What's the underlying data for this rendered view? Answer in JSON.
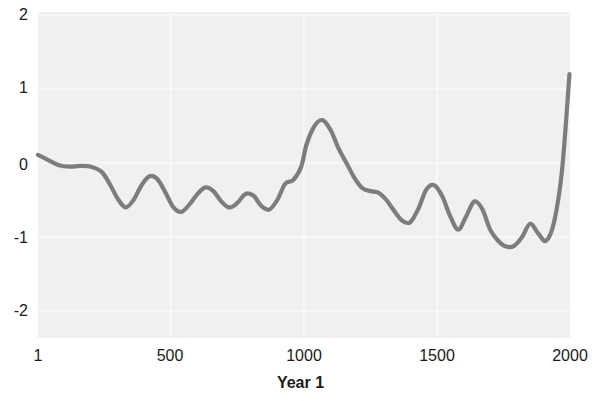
{
  "chart_data": {
    "type": "line",
    "title": "",
    "xlabel": "Year 1",
    "ylabel": "",
    "xlim": [
      1,
      2000
    ],
    "ylim": [
      -2.4,
      2.2
    ],
    "xticks": [
      1,
      500,
      1000,
      1500,
      2000
    ],
    "xtick_labels": [
      "1",
      "500",
      "1000",
      "1500",
      "2000"
    ],
    "yticks": [
      2,
      1,
      0,
      -1,
      -2
    ],
    "ytick_labels": [
      "2",
      "1",
      "0",
      "-1",
      "-2"
    ],
    "grid": true,
    "legend": "none",
    "line_color": "#7d7d7d",
    "plot_background": "#f0f0f0",
    "series": [
      {
        "name": "series-1",
        "x": [
          1,
          40,
          80,
          120,
          160,
          200,
          240,
          270,
          300,
          330,
          360,
          390,
          420,
          450,
          480,
          510,
          540,
          570,
          600,
          630,
          660,
          690,
          720,
          750,
          780,
          810,
          840,
          870,
          900,
          930,
          960,
          990,
          1010,
          1040,
          1070,
          1100,
          1130,
          1160,
          1190,
          1220,
          1250,
          1280,
          1310,
          1340,
          1370,
          1400,
          1430,
          1460,
          1490,
          1520,
          1550,
          1580,
          1610,
          1640,
          1670,
          1700,
          1730,
          1760,
          1790,
          1820,
          1850,
          1880,
          1910,
          1940,
          1970,
          1998
        ],
        "y": [
          0.11,
          0.04,
          -0.03,
          -0.05,
          -0.04,
          -0.05,
          -0.12,
          -0.28,
          -0.48,
          -0.6,
          -0.5,
          -0.3,
          -0.18,
          -0.22,
          -0.4,
          -0.6,
          -0.66,
          -0.56,
          -0.42,
          -0.33,
          -0.38,
          -0.52,
          -0.6,
          -0.54,
          -0.42,
          -0.44,
          -0.58,
          -0.63,
          -0.5,
          -0.28,
          -0.23,
          -0.05,
          0.25,
          0.5,
          0.58,
          0.45,
          0.2,
          0.0,
          -0.2,
          -0.34,
          -0.38,
          -0.4,
          -0.5,
          -0.65,
          -0.78,
          -0.8,
          -0.62,
          -0.36,
          -0.3,
          -0.45,
          -0.72,
          -0.9,
          -0.72,
          -0.52,
          -0.62,
          -0.9,
          -1.05,
          -1.13,
          -1.12,
          -1.0,
          -0.82,
          -0.95,
          -1.05,
          -0.8,
          -0.1,
          1.2
        ]
      }
    ]
  },
  "axes": {
    "y_tick_pixels": [
      15,
      88,
      165,
      238,
      311
    ],
    "x_tick_pixels": [
      38,
      170,
      304,
      437,
      570
    ]
  }
}
